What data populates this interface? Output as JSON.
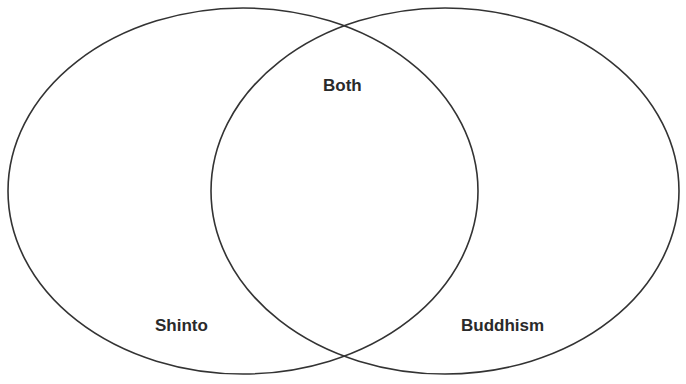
{
  "diagram": {
    "type": "venn",
    "stroke_color": "#333333",
    "sets": [
      {
        "id": "left",
        "label": "Shinto"
      },
      {
        "id": "right",
        "label": "Buddhism"
      }
    ],
    "intersection": {
      "label": "Both"
    }
  }
}
